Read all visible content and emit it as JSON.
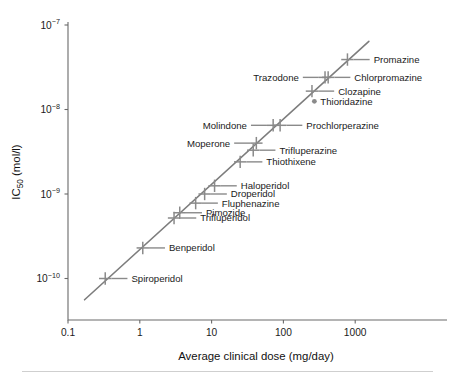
{
  "chart_data": {
    "type": "scatter",
    "title": "",
    "xlabel": "Average clinical dose (mg/day)",
    "ylabel": "IC50 (mol/l)",
    "ylabel_base": "IC",
    "ylabel_sub": "50",
    "ylabel_unit": " (mol/l)",
    "xscale": "log",
    "yscale": "log",
    "xlim": [
      0.1,
      2000
    ],
    "ylim": [
      5e-11,
      1e-07
    ],
    "grid": false,
    "legend": null,
    "xticks": [
      0.1,
      1,
      10,
      100,
      1000
    ],
    "xtick_labels": [
      "0.1",
      "1",
      "10",
      "100",
      "1000"
    ],
    "yticks": [
      1e-07,
      1e-08,
      1e-09,
      1e-10
    ],
    "ytick_labels": [
      "10-7",
      "10-8",
      "10-9",
      "10-10"
    ],
    "ytick_mantissa": "10",
    "ytick_exponents": [
      "−7",
      "−8",
      "−9",
      "−10"
    ],
    "marker_style": "cross",
    "fit_line": {
      "x_start": 0.17,
      "y_start": 5.6e-11,
      "x_end": 1550,
      "y_end": 6.4e-08
    },
    "points": [
      {
        "label": "Promazine",
        "x": 780,
        "y": 3.9e-08,
        "side": "right",
        "marker": "cross"
      },
      {
        "label": "Chlorpromazine",
        "x": 420,
        "y": 2.4e-08,
        "side": "right",
        "marker": "cross"
      },
      {
        "label": "Trazodone",
        "x": 380,
        "y": 2.4e-08,
        "side": "left",
        "marker": "cross"
      },
      {
        "label": "Clozapine",
        "x": 250,
        "y": 1.65e-08,
        "side": "right",
        "marker": "cross"
      },
      {
        "label": "Thioridazine",
        "x": 270,
        "y": 1.25e-08,
        "side": "right",
        "marker": "dot"
      },
      {
        "label": "Prochlorperazine",
        "x": 90,
        "y": 6.5e-09,
        "side": "right",
        "marker": "cross"
      },
      {
        "label": "Molindone",
        "x": 72,
        "y": 6.5e-09,
        "side": "left",
        "marker": "cross"
      },
      {
        "label": "Moperone",
        "x": 42,
        "y": 4e-09,
        "side": "left",
        "marker": "cross"
      },
      {
        "label": "Trifluperazine",
        "x": 38,
        "y": 3.3e-09,
        "side": "right",
        "marker": "cross"
      },
      {
        "label": "Thiothixene",
        "x": 25,
        "y": 2.4e-09,
        "side": "right",
        "marker": "cross"
      },
      {
        "label": "Haloperidol",
        "x": 11,
        "y": 1.25e-09,
        "side": "right",
        "marker": "cross"
      },
      {
        "label": "Droperidol",
        "x": 8.0,
        "y": 1e-09,
        "side": "right",
        "marker": "cross"
      },
      {
        "label": "Fluphenazine",
        "x": 6.0,
        "y": 7.8e-10,
        "side": "right",
        "marker": "cross"
      },
      {
        "label": "Pimozide",
        "x": 3.6,
        "y": 6e-10,
        "side": "right",
        "marker": "cross"
      },
      {
        "label": "Trifluperidol",
        "x": 3.0,
        "y": 5.2e-10,
        "side": "right",
        "marker": "cross"
      },
      {
        "label": "Benperidol",
        "x": 1.1,
        "y": 2.3e-10,
        "side": "right",
        "marker": "cross"
      },
      {
        "label": "Spiroperidol",
        "x": 0.33,
        "y": 1e-10,
        "side": "right",
        "marker": "cross"
      }
    ]
  },
  "colors": {
    "line": "#7d7d7d",
    "marker": "#8a8a8a",
    "axis": "#6a6a6a",
    "text": "#1b1b1b",
    "rule": "#cfcfcf",
    "background": "#ffffff"
  }
}
